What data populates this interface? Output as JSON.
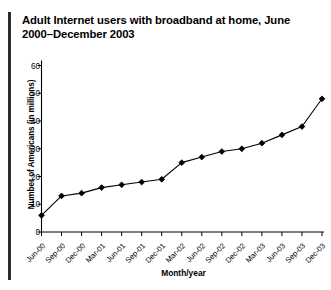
{
  "figure": {
    "title": "Adult Internet users with broadband at home, June 2000–December 2003"
  },
  "chart_data": {
    "type": "line",
    "title": "Adult Internet users with broadband at home, June 2000–December 2003",
    "xlabel": "Month/year",
    "ylabel": "Number of Americans (in millions)",
    "categories": [
      "Jun-00",
      "Sep-00",
      "Dec-00",
      "Mar-01",
      "Jun-01",
      "Sep-01",
      "Dec-01",
      "Mar-02",
      "Jun-02",
      "Sep-02",
      "Dec-02",
      "Mar-03",
      "Jun-03",
      "Sep-03",
      "Dec-03"
    ],
    "values": [
      6,
      13,
      14,
      16,
      17,
      18,
      19,
      25,
      27,
      29,
      30,
      32,
      35,
      38,
      48
    ],
    "ylim": [
      0,
      60
    ],
    "yticks": [
      0,
      10,
      20,
      30,
      40,
      50,
      60
    ],
    "grid": false,
    "legend": false,
    "marker": "diamond",
    "line_color": "#000000",
    "marker_color": "#000000"
  }
}
